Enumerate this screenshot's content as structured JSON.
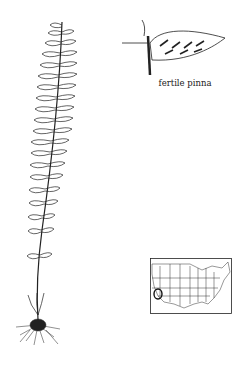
{
  "illustration": {
    "subject": "fern frond with rhizome and roots",
    "inset_caption": "fertile pinna",
    "map": {
      "region": "United States",
      "highlight": "southern California"
    }
  },
  "colors": {
    "ink": "#1a1a1a",
    "background": "#ffffff"
  }
}
